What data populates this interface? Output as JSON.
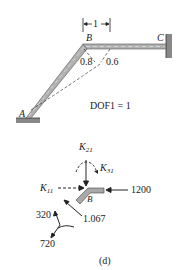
{
  "figure": {
    "caption": "(d)",
    "top": {
      "dimension_label": "1",
      "nodes": {
        "A": "A",
        "B": "B",
        "C": "C"
      },
      "slope_labels": {
        "left": "0.8",
        "right": "0.6"
      },
      "dof_label": "DOF1 = 1"
    },
    "bottom": {
      "node_label": "B",
      "k21": {
        "main": "K",
        "sub": "21"
      },
      "k31": {
        "main": "K",
        "sub": "31"
      },
      "k11": {
        "main": "K",
        "sub": "11"
      },
      "force_right": "1200",
      "force_diag": "1.067",
      "force_up": "320",
      "force_down": "720"
    }
  },
  "colors": {
    "member": "#9a9a9a",
    "line": "#222222",
    "background": "#ffffff"
  }
}
